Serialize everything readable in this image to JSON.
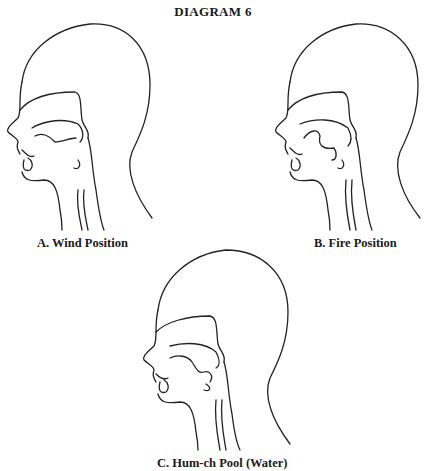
{
  "title": "DIAGRAM 6",
  "figures": [
    {
      "id": "A",
      "caption": "A. Wind Position",
      "variant": "wind"
    },
    {
      "id": "B",
      "caption": "B. Fire Position",
      "variant": "fire"
    },
    {
      "id": "C",
      "caption": "C. Hum-ch Pool (Water)",
      "variant": "water"
    }
  ]
}
